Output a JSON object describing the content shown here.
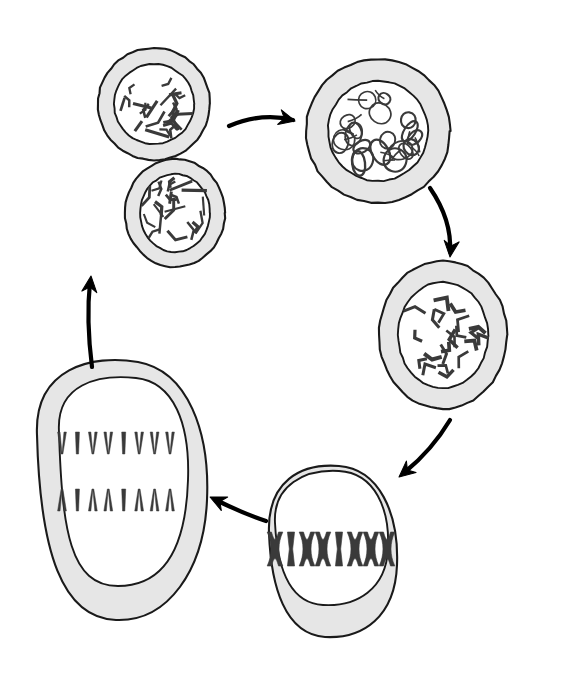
{
  "figure": {
    "background_color": "#ffffff",
    "cytoplasm_color": "#e6e6e6",
    "nucleoplasm_color": "#ffffff",
    "outline_color": "#1a1a1a",
    "chromosome_color": "#3a3a3a",
    "arrow_color": "#000000"
  },
  "stages": [
    {
      "id": "interphase",
      "label": "Interphase cell with dispersed chromatin threads",
      "cell_shape": "circle",
      "center": [
        154,
        104
      ],
      "cell_rx": 56,
      "cell_ry": 56,
      "nucleus_rx": 40,
      "nucleus_ry": 40,
      "chromatin_style": "short-dashes",
      "chromatin_count": 24
    },
    {
      "id": "prophase",
      "label": "Prophase cell with tangled condensing chromosomes",
      "cell_shape": "circle",
      "center": [
        378,
        131
      ],
      "cell_rx": 72,
      "cell_ry": 72,
      "nucleus_rx": 50,
      "nucleus_ry": 50,
      "chromatin_style": "tangled-loops",
      "chromatin_count": 20
    },
    {
      "id": "prometaphase",
      "label": "Cell with fully condensed V-shaped chromosomes",
      "cell_shape": "ellipse",
      "center": [
        443,
        335
      ],
      "cell_rx": 64,
      "cell_ry": 74,
      "nucleus_rx": 45,
      "nucleus_ry": 53,
      "chromatin_style": "v-shapes",
      "chromatin_count": 22
    },
    {
      "id": "metaphase",
      "label": "Metaphase cell with chromosomes aligned at equator",
      "cell_shape": "ellipse",
      "center": [
        333,
        551
      ],
      "cell_rx": 64,
      "cell_ry": 85,
      "nucleus_rx": 55,
      "nucleus_ry": 57,
      "chromatin_style": "metaphase-plate",
      "chromosome_glyphs": [
        "X",
        "I",
        "X",
        "X",
        "I",
        "X",
        "X",
        "X"
      ],
      "chromosome_count": 8
    },
    {
      "id": "anaphase",
      "label": "Anaphase cell with sister chromatids moving to poles",
      "cell_shape": "rounded-ellipse",
      "center": [
        122,
        490
      ],
      "cell_rx": 85,
      "cell_ry": 125,
      "nucleus_rx": 62,
      "nucleus_ry": 98,
      "chromatin_style": "two-poles",
      "top_row_glyphs": [
        "V",
        "I",
        "V",
        "V",
        "I",
        "V",
        "V",
        "V"
      ],
      "bottom_row_glyphs": [
        "A",
        "I",
        "A",
        "A",
        "I",
        "A",
        "A",
        "A"
      ],
      "top_row_count": 8,
      "bottom_row_count": 8
    },
    {
      "id": "daughter-cell",
      "label": "Daughter cell returning to interphase",
      "cell_shape": "ellipse",
      "center": [
        175,
        213
      ],
      "cell_rx": 50,
      "cell_ry": 54,
      "nucleus_rx": 35,
      "nucleus_ry": 39,
      "chromatin_style": "short-dashes",
      "chromatin_count": 22
    }
  ],
  "arrows": [
    {
      "id": "arrow-interphase-to-prophase",
      "label": "interphase to prophase",
      "direction": "right",
      "path": "M 229 126 Q 262 112 293 120",
      "head_at": [
        295,
        121
      ],
      "head_angle": 14
    },
    {
      "id": "arrow-prophase-to-prometaphase",
      "label": "prophase to condensed chromosomes",
      "direction": "down-right",
      "path": "M 430 188 Q 452 220 450 252",
      "head_at": [
        450,
        257
      ],
      "head_angle": 96
    },
    {
      "id": "arrow-prometaphase-to-metaphase",
      "label": "condensed chromosomes to metaphase",
      "direction": "down-left",
      "path": "M 450 420 Q 432 450 405 472",
      "head_at": [
        399,
        477
      ],
      "head_angle": 140
    },
    {
      "id": "arrow-metaphase-to-anaphase",
      "label": "metaphase to anaphase",
      "direction": "left",
      "path": "M 266 521 Q 242 513 216 500",
      "head_at": [
        210,
        497
      ],
      "head_angle": 205
    },
    {
      "id": "arrow-anaphase-to-daughter",
      "label": "anaphase to daughter cell",
      "direction": "up",
      "path": "M 92 367 Q 86 320 90 282",
      "head_at": [
        91,
        276
      ],
      "head_angle": -84
    }
  ]
}
